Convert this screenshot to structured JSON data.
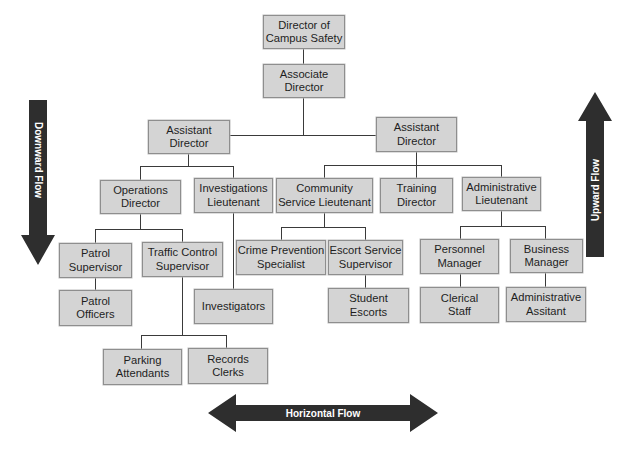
{
  "diagram": {
    "type": "organizational-chart"
  },
  "nodes": {
    "director": {
      "label": "Director of\nCampus Safety"
    },
    "associate_director": {
      "label": "Associate\nDirector"
    },
    "assistant_director_left": {
      "label": "Assistant\nDirector"
    },
    "assistant_director_right": {
      "label": "Assistant\nDirector"
    },
    "operations_director": {
      "label": "Operations\nDirector"
    },
    "investigations_lieutenant": {
      "label": "Investigations\nLieutenant"
    },
    "community_service_lieutenant": {
      "label": "Community\nService Lieutenant"
    },
    "training_director": {
      "label": "Training\nDirector"
    },
    "administrative_lieutenant": {
      "label": "Administrative\nLieutenant"
    },
    "patrol_supervisor": {
      "label": "Patrol\nSupervisor"
    },
    "traffic_control_supervisor": {
      "label": "Traffic Control\nSupervisor"
    },
    "crime_prevention_specialist": {
      "label": "Crime Prevention\nSpecialist"
    },
    "escort_service_supervisor": {
      "label": "Escort Service\nSupervisor"
    },
    "personnel_manager": {
      "label": "Personnel\nManager"
    },
    "business_manager": {
      "label": "Business\nManager"
    },
    "patrol_officers": {
      "label": "Patrol\nOfficers"
    },
    "investigators": {
      "label": "Investigators"
    },
    "student_escorts": {
      "label": "Student\nEscorts"
    },
    "clerical_staff": {
      "label": "Clerical\nStaff"
    },
    "administrative_assitant": {
      "label": "Administrative\nAssitant"
    },
    "parking_attendants": {
      "label": "Parking\nAttendants"
    },
    "records_clerks": {
      "label": "Records\nClerks"
    }
  },
  "edges": [
    [
      "director",
      "associate_director"
    ],
    [
      "associate_director",
      "assistant_director_left"
    ],
    [
      "associate_director",
      "assistant_director_right"
    ],
    [
      "assistant_director_left",
      "operations_director"
    ],
    [
      "assistant_director_left",
      "investigations_lieutenant"
    ],
    [
      "assistant_director_right",
      "community_service_lieutenant"
    ],
    [
      "assistant_director_right",
      "training_director"
    ],
    [
      "assistant_director_right",
      "administrative_lieutenant"
    ],
    [
      "operations_director",
      "patrol_supervisor"
    ],
    [
      "operations_director",
      "traffic_control_supervisor"
    ],
    [
      "patrol_supervisor",
      "patrol_officers"
    ],
    [
      "traffic_control_supervisor",
      "parking_attendants"
    ],
    [
      "traffic_control_supervisor",
      "records_clerks"
    ],
    [
      "investigations_lieutenant",
      "investigators"
    ],
    [
      "community_service_lieutenant",
      "crime_prevention_specialist"
    ],
    [
      "community_service_lieutenant",
      "escort_service_supervisor"
    ],
    [
      "escort_service_supervisor",
      "student_escorts"
    ],
    [
      "administrative_lieutenant",
      "personnel_manager"
    ],
    [
      "administrative_lieutenant",
      "business_manager"
    ],
    [
      "personnel_manager",
      "clerical_staff"
    ],
    [
      "business_manager",
      "administrative_assitant"
    ]
  ],
  "arrows": {
    "downward": {
      "label": "Downward Flow",
      "direction": "down"
    },
    "upward": {
      "label": "Upward Flow",
      "direction": "up"
    },
    "horizontal": {
      "label": "Horizontal Flow",
      "direction": "left-right"
    }
  },
  "colors": {
    "box_fill": "#d4d4d4",
    "box_border": "#8e8e8e",
    "line": "#3a3a3a",
    "arrow_fill": "#2e2e2e",
    "arrow_text": "#ffffff"
  }
}
